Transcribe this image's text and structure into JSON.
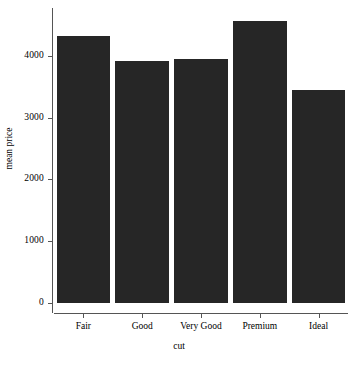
{
  "chart_data": {
    "type": "bar",
    "title": "",
    "subtitle": "",
    "xlabel": "cut",
    "ylabel": "mean price",
    "categories": [
      "Fair",
      "Good",
      "Very Good",
      "Premium",
      "Ideal"
    ],
    "values": [
      4320,
      3920,
      3950,
      4560,
      3440
    ],
    "series": [
      {
        "name": "mean price",
        "values": [
          4320,
          3920,
          3950,
          4560,
          3440
        ]
      }
    ],
    "ylim": [
      0,
      4600
    ],
    "ytick_labels": [
      "0",
      "1000",
      "2000",
      "3000",
      "4000"
    ],
    "ytick_values": [
      0,
      1000,
      2000,
      3000,
      4000
    ],
    "xtick_labels": [
      "Fair",
      "Good",
      "Very Good",
      "Premium",
      "Ideal"
    ],
    "grid": false,
    "legend": "none",
    "bar_color": "#262626",
    "axis_color": "#555555",
    "background": "#ffffff"
  }
}
